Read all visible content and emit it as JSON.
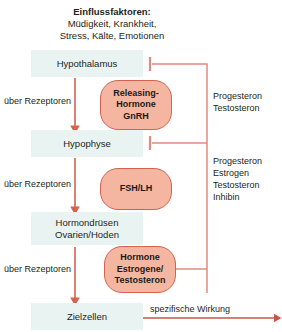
{
  "diagram": {
    "title_block": {
      "heading": "Einflussfaktoren:",
      "line1": "Müdigkeit, Krankheit,",
      "line2": "Stress, Kälte, Emotionen"
    },
    "organs": [
      {
        "id": "hypothalamus",
        "label": "Hypothalamus"
      },
      {
        "id": "hypophyse",
        "label": "Hypophyse"
      },
      {
        "id": "hormondruesen",
        "line1": "Hormondrüsen",
        "line2": "Ovarien/Hoden"
      },
      {
        "id": "zielzellen",
        "label": "Zielzellen"
      }
    ],
    "hormones": [
      {
        "id": "gnrh",
        "line1": "Releasing-",
        "line2": "Hormone",
        "line3": "GnRH"
      },
      {
        "id": "fshlh",
        "line1": "FSH/LH"
      },
      {
        "id": "sexhormone",
        "line1": "Hormone",
        "line2": "Estrogene/",
        "line3": "Testosteron"
      }
    ],
    "receptor_labels": [
      "über Rezeptoren",
      "über Rezeptoren",
      "über Rezeptoren"
    ],
    "feedback_labels": [
      {
        "id": "feedback-top",
        "text": "Progesteron\nTestosteron"
      },
      {
        "id": "feedback-bottom",
        "text": "Progesteron\nEstrogen\nTestosteron\nInhibin"
      }
    ],
    "effect_label": "spezifische Wirkung",
    "colors": {
      "organ_fill": "#e9f4f2",
      "hormone_fill": "#f4b6a0",
      "hormone_stroke": "#d4624f",
      "arrow": "#d4624f",
      "feedback": "#e08a80",
      "text": "#231f20"
    }
  }
}
